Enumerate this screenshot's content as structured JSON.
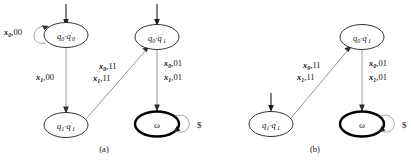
{
  "figure": {
    "panels": [
      {
        "id": "a",
        "caption": "(a)",
        "states": [
          {
            "id": "q0q0p",
            "label": "q0·q'0",
            "text_main": "q",
            "accepting": false,
            "start": true
          },
          {
            "id": "q1q1p",
            "label": "q1·q'1",
            "text_main": "q",
            "accepting": false,
            "start": false
          },
          {
            "id": "q0q1p",
            "label": "q0·q'1",
            "text_main": "q",
            "accepting": false,
            "start": true
          },
          {
            "id": "omega",
            "label": "ω",
            "accepting": true,
            "start": false
          }
        ],
        "state_labels": {
          "q0q0p": {
            "a": "q",
            "asub": "0",
            "mid": "·",
            "b": "q",
            "bprime": "′",
            "bsub": "0"
          },
          "q1q1p": {
            "a": "q",
            "asub": "1",
            "mid": "·",
            "b": "q",
            "bprime": "′",
            "bsub": "1"
          },
          "q0q1p": {
            "a": "q",
            "asub": "0",
            "mid": "·",
            "b": "q",
            "bprime": "′",
            "bsub": "1"
          },
          "omega": {
            "a": "ω"
          }
        },
        "transitions": [
          {
            "id": "selfloop-q0q0p",
            "from": "q0q0p",
            "to": "q0q0p",
            "labels": [
              {
                "var": "x",
                "sub": "0",
                "out": ",00"
              }
            ]
          },
          {
            "id": "q0q0p-to-q1q1p",
            "from": "q0q0p",
            "to": "q1q1p",
            "labels": [
              {
                "var": "x",
                "sub": "1",
                "out": ",00"
              }
            ]
          },
          {
            "id": "q1q1p-to-q0q1p",
            "from": "q1q1p",
            "to": "q0q1p",
            "labels": [
              {
                "var": "x",
                "sub": "0",
                "out": ",11"
              },
              {
                "var": "x",
                "sub": "1",
                "out": ",11"
              }
            ]
          },
          {
            "id": "q0q1p-to-omega",
            "from": "q0q1p",
            "to": "omega",
            "labels": [
              {
                "var": "x",
                "sub": "0",
                "out": ",01"
              },
              {
                "var": "x",
                "sub": "1",
                "out": ",01"
              }
            ]
          },
          {
            "id": "selfloop-omega",
            "from": "omega",
            "to": "omega",
            "labels": [
              {
                "var": "",
                "sub": "",
                "out": "$"
              }
            ]
          }
        ]
      },
      {
        "id": "b",
        "caption": "(b)",
        "states": [
          {
            "id": "q1q1p",
            "label": "q1·q'1",
            "accepting": false,
            "start": true
          },
          {
            "id": "q0q1p",
            "label": "q0·q'1",
            "accepting": false,
            "start": false
          },
          {
            "id": "omega",
            "label": "ω",
            "accepting": true,
            "start": false
          }
        ],
        "state_labels": {
          "q1q1p": {
            "a": "q",
            "asub": "1",
            "mid": "·",
            "b": "q",
            "bprime": "′",
            "bsub": "1"
          },
          "q0q1p": {
            "a": "q",
            "asub": "0",
            "mid": "·",
            "b": "q",
            "bprime": "′",
            "bsub": "1"
          },
          "omega": {
            "a": "ω"
          }
        },
        "transitions": [
          {
            "id": "q1q1p-to-q0q1p",
            "from": "q1q1p",
            "to": "q0q1p",
            "labels": [
              {
                "var": "x",
                "sub": "0",
                "out": ",11"
              },
              {
                "var": "x",
                "sub": "1",
                "out": ",11"
              }
            ]
          },
          {
            "id": "q0q1p-to-omega",
            "from": "q0q1p",
            "to": "omega",
            "labels": [
              {
                "var": "x",
                "sub": "0",
                "out": ",01"
              },
              {
                "var": "x",
                "sub": "1",
                "out": ",01"
              }
            ]
          },
          {
            "id": "selfloop-omega",
            "from": "omega",
            "to": "omega",
            "labels": [
              {
                "var": "",
                "sub": "",
                "out": "$"
              }
            ]
          }
        ]
      }
    ]
  },
  "text": {
    "var_x": "x",
    "sub_0": "0",
    "sub_1": "1",
    "prime": "′",
    "dot": "·",
    "omega": "ω",
    "dollar": "$",
    "out_00": ",00",
    "out_11": ",11",
    "out_01": ",01",
    "caption_a": "(a)",
    "caption_b": "(b)"
  },
  "colors": {
    "node_stroke": "#1c1c1c",
    "accept_stroke": "#000000",
    "edge_stroke": "#8a8a8a",
    "text": "#111111",
    "background": "#ffffff"
  }
}
